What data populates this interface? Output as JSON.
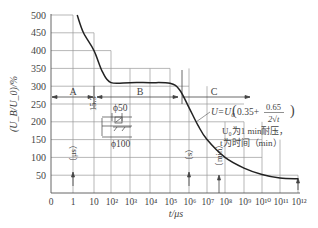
{
  "chart_data": {
    "type": "line",
    "title": "",
    "xlabel": "t/μs",
    "ylabel": "(U_B/U_0)/%",
    "x_scale": "log",
    "x_tick_labels": [
      "0",
      "1",
      "10",
      "10²",
      "10³",
      "10⁴",
      "10⁵",
      "10⁶",
      "10⁷",
      "10⁸",
      "10⁹",
      "10¹⁰",
      "10¹¹",
      "10¹²"
    ],
    "y_tick_labels": [
      "50",
      "100",
      "150",
      "200",
      "250",
      "300",
      "350",
      "400",
      "450",
      "500"
    ],
    "ylim": [
      0,
      500
    ],
    "grid": true,
    "series": [
      {
        "name": "U_B/U_0",
        "points": [
          {
            "t_exp": 0.2,
            "y": 500
          },
          {
            "t_exp": 0.5,
            "y": 450
          },
          {
            "t_exp": 1.0,
            "y": 400
          },
          {
            "t_exp": 1.5,
            "y": 340
          },
          {
            "t_exp": 2.0,
            "y": 310
          },
          {
            "t_exp": 3.0,
            "y": 310
          },
          {
            "t_exp": 4.0,
            "y": 310
          },
          {
            "t_exp": 5.0,
            "y": 308
          },
          {
            "t_exp": 5.5,
            "y": 290
          },
          {
            "t_exp": 6.0,
            "y": 240
          },
          {
            "t_exp": 6.5,
            "y": 190
          },
          {
            "t_exp": 7.0,
            "y": 150
          },
          {
            "t_exp": 8.0,
            "y": 100
          },
          {
            "t_exp": 9.0,
            "y": 70
          },
          {
            "t_exp": 10.0,
            "y": 52
          },
          {
            "t_exp": 11.0,
            "y": 42
          },
          {
            "t_exp": 12.0,
            "y": 40
          }
        ]
      }
    ],
    "regions": [
      {
        "label": "A",
        "from": "0",
        "to": "10²"
      },
      {
        "label": "B",
        "from": "10²",
        "to": "10⁶"
      },
      {
        "label": "C",
        "from": "10⁶",
        "to": "10¹²"
      }
    ],
    "annotations": {
      "formula": "U=U₀(0.35+ 0.65/2√t)",
      "formula_prefix": "U=U",
      "formula_sub": "0",
      "formula_const": "0.35+",
      "formula_num": "0.65",
      "formula_den": "2√t",
      "note_line1": "U₀为1 min耐压，",
      "note_line2": "t为时间（min）",
      "unit_us": "（μs）",
      "unit_s": "（s）",
      "unit_min": "（min）",
      "dim_15": "15.3",
      "phi50": "ϕ50",
      "phi100": "ϕ100"
    }
  }
}
